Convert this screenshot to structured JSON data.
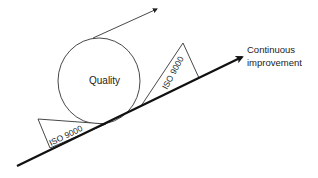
{
  "diagram": {
    "type": "quality-wheel-on-slope",
    "colors": {
      "line": "#111111",
      "thin_stroke": "#333333",
      "text": "#222222",
      "background": "#ffffff"
    },
    "circle": {
      "label": "Quality"
    },
    "slope_arrow": {
      "label_line1": "Continuous",
      "label_line2": "improvement"
    },
    "wedges": [
      {
        "label": "ISO 9000",
        "position": "lower-left"
      },
      {
        "label": "ISO 9000",
        "position": "upper-right"
      }
    ],
    "momentum_arrow": {
      "label": ""
    }
  }
}
